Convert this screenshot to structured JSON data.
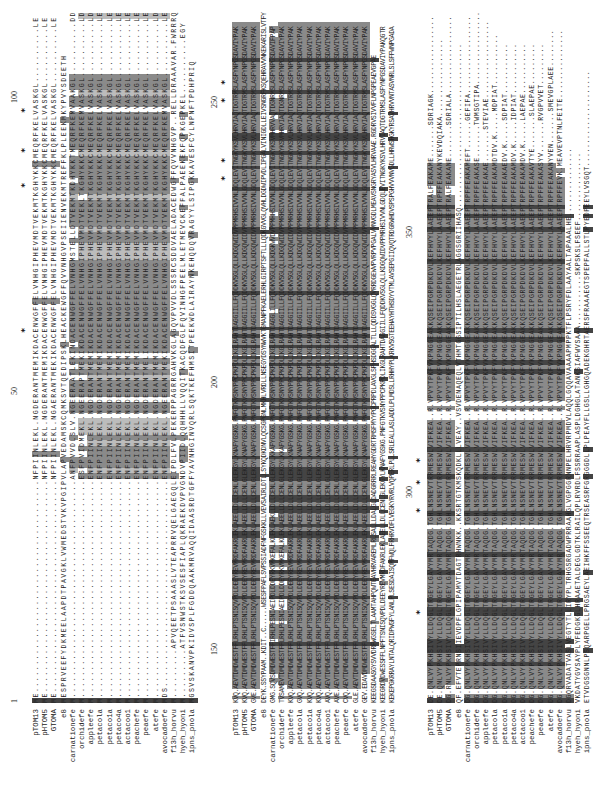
{
  "figure": {
    "type": "multiple_sequence_alignment",
    "orientation": "rotated-90-ccw",
    "sequence_names": [
      "pTOM13",
      "pHTOM5",
      "GTOMA",
      "e8",
      "carnationefe",
      "orchidefe",
      "appleefe",
      "petacola",
      "petaco1a",
      "petaco4a",
      "actacoo1",
      "peachefe",
      "peaefe",
      "atefe",
      "avocadoefe",
      "f13h_horvu",
      "hyeh_hyoni",
      "ipns_pnola"
    ],
    "colors": {
      "identical": "#444444",
      "similar": "#8a8a8a",
      "weak": "#bcbcbc",
      "text": "#222222",
      "background": "#ffffff"
    }
  },
  "panels": [
    {
      "id": "block-1",
      "ruler": [
        {
          "label": "1",
          "pos": 100
        },
        {
          "label": "50",
          "pos": 408
        },
        {
          "label": "100",
          "pos": 700
        }
      ],
      "stars": [
        470,
        615,
        650,
        690
      ],
      "rows": [
        {
          "name": "pTOM13",
          "seq": "ME.......................................NFPIINLEKL.NGDERANTMEMIKDACENWGFFELVNHGIPHEVMDTVEKMTKGHYKKCMEQRFKELVASKGL..........LE"
        },
        {
          "name": "pHTOM5",
          "seq": "ME.......................................NFPIINLEKL.NGDERANTMEMIKDACENWGFFELVNHGIPHEVMDTVEKMTKGHYKKCMEQRFKELVASKGL..........LE"
        },
        {
          "name": "GTOMA",
          "seq": "ME.......................................NFPIINLEKL.NGAERANTMEKIKDACENWGFFELVNHGIPHEVMDTVEKMTKGHYKKCMEQRFKELVASKGL..........LE"
        },
        {
          "name": "e8",
          "seq": "MESPRVEEFYDKMEELAAPDTPAVGKLVWMEDSTVKVPGIPVLAPVEDAMSKCQMKSVTQEDIPSKLHEACKEWGFFQVVNHGVPSEIIENVEKMTREFFKLPLEEKMKYPVYSDEETH"
        },
        {
          "name": "carnationefe",
          "seq": "M........................................ANFPVVDLSLV.NGEERAATLEKINDACENWGFFELVNHGMSTELLDTVEKMTKDHYKKTMEQRFKEMVAAKGL..........DD"
        },
        {
          "name": "orchidefe",
          "seq": "M........................................ESFPVIDMEKL.NGEERAPTMEKIKDACENWGFFELVNHGIPHEVMDTVEKLTKGHYKKCMEQRFKEMVASKGL..........LD"
        },
        {
          "name": "appleefe",
          "seq": "M........................................ENFPIINLEKL.NGDERANTMEMIKDACENWGFFELVNHGIPHEVMDTVEKMTKGHYKKCMEQRFKELVASKGL..........LD"
        },
        {
          "name": "petacola",
          "seq": "M........................................ENFPIINLEKL.NGDERANTMEMIKDACENWGFFELVNHGIPHEVMDTVEKMTKGHYKKCMEQRFKELVASKGL..........LE"
        },
        {
          "name": "petaco1a",
          "seq": "M........................................ENFPIINLEKL.NGDERANTMEMIKDACENWGFFELVNHGIPHEVMDTVEKMTKGHYKKCMEQRFKELVASKGL..........LE"
        },
        {
          "name": "petaco4a",
          "seq": "M........................................ENFPIINLEKL.NGDERANTMEMIKDACENWGFFELVNHGIPHEVMDTVEKMTKGHYKKCMEQRFKELVASKGL..........LE"
        },
        {
          "name": "actacoo1",
          "seq": "M........................................ENFPIINLEKL.NGDERANTMEMIKDACENWGFFELVNHGIPHEVMDTVEKMTKGHYKKCMEQRFKELVASKGL..........LE"
        },
        {
          "name": "peachefe",
          "seq": "M........................................ENFPIINLEKL.NGDERANTMEMIKDACENWGFFELVNHGIPHEVMDTVEKMTKGHYKKCMEQRFKELVASKGL..........LE"
        },
        {
          "name": "peaefe",
          "seq": "M........................................ENFPIINLEKL.NGDERANTMELIKDACENWGFFELVNHGIPHEVMDTVEKMTKGHYKKCMEQRFKELVASKGL..........LE"
        },
        {
          "name": "atefe",
          "seq": "M........................................ENFPIINLEKL.NGDERANTMEMIKDACENWGFFELVNHGIPHEVMDTVEKMTKGHYKKCMEQRFKELVASKGL..........LD"
        },
        {
          "name": "avocadoefe",
          "seq": "MDS......................................ENFPIINLEKL.NGEERANTMEKIKDACENWGFFELVNHGIPHEVMDTVEKMTKGHYKKCMEQRFKEMVASKGL..........LE"
        },
        {
          "name": "f13h_horvu",
          "seq": "M.........APVQEETPSAAASLVTEAPRRVQELGAEGQLEIPDLFVLPEKERPPAGRRGAHVKGLAGQVPVVDLSSSRCSDDVAELADACEDWGFFQVVNHGVP..RELLDRAAAVAR.FWRRRQ"
        },
        {
          "name": "hyeh_hyoni",
          "seq": "M.........ATFVSNWSTKSVSESFIAPLQKRAEKDVPVGNDVPIIDLQQHHHLLVQQITKACQDFGLFQVINHGFPEELMLETMEVCKEFFALPAEEKEKFQPKGEPKEL..........EGY"
        },
        {
          "name": "ipns_pnola",
          "seq": "MGSVSKANVPKIDVSPLFGDDQAAKMRVAQQIDAASRDTGFFYAVNHGINVQRLSQKTKEFHMSITPEEKWDLAIRAYNKEHQDQVRAGYYLSIPGKKAVESFCYLNPNFTPDHPRIQ"
        }
      ]
    },
    {
      "id": "block-2",
      "ruler": [
        {
          "label": "150",
          "pos": 148
        },
        {
          "label": "200",
          "pos": 415
        },
        {
          "label": "250",
          "pos": 695
        }
      ],
      "stars": [
        622,
        640,
        700,
        718
      ],
      "rows": [
        {
          "name": "pTOM13",
          "seq": "KVQ.AEVTDMDWESTFFLRHLPTSNISQVPDLDEEYREVMRDFAKRLEKLAEELLDLLCENLGLEKGYLKNAFYGSKG.PNFGTKVSNYPPCPKPDLIKGLRAHTDAGGIILLFQDDKVSGLQLLKDGQWIDVPPMRHSIVVNLGDQLEVITNGKYKSVLHRVIAQTDGTRMSLASFYNPGSDAVIYPAK"
        },
        {
          "name": "pHTOM5",
          "seq": "KVQ.AEVTDMDWESTFFLRHLPTSNISQVPDLDEEYREVMRDFAKRLEKLAEELLDLLCENLGLEKGYLKNAFYGSKG.PNFGTKVSNYPPCPKPDLIKGLRAHTDAGGIILLFQDDKVSGLQLLKDGQWIDVPPMRHSIVVNLGDQLEVITNGKYKSVLHRVIAQTDGTRMSLASFYNPGSDAVIYPAK"
        },
        {
          "name": "GTOMA",
          "seq": "GVE.AEVTDMDWESTFFLRHLPTSNISQVPDLDEEYREVMRDFAKRLEKLAEELLDLLCENLGLEKGYLKNAFYGSKG.PNFGTKVSNYPPCPKPDLIKGLRAHTDAGGIILLFQDDKVSGLQLLKDGQWIDVPPMRHSIVVNLGDQLEVITNGKYKSVLHRVIAQTDGTRMSLASFYNPGSDAVIYPAK"
        },
        {
          "name": "e8",
          "seq": "DEYK.SSYPAAM..KDIT..C......WSESFPAFLSVPSSIADFNFGSKKLLVEVSAIRLDTLLSYKQDKDNVLQCSGPGNLMKHLVRDLLNSEGYDSYNWVKTGMANPFKAELERHLGIRPTSFTLLLQDKGVVGLQVHLDGDWIPVDLIPGALVINIGDLLEIVSNGRFKSQEHRAVVNKEKARISLVTFY"
        },
        {
          "name": "carnationefe",
          "seq": "GMG.SQVSDMDWESTFFIRHLPESNIAEIPDLDDEYRKVMKEFALKLEKLAEKLLDLLCENLGLEKGYLKKAFYGSKG.PNFGTKVSNYPPCPKPDLIKGLRAHTDAGGLILLFQDDKVSGLQLLKDGKWVDVPPMHHSIVVNLGDQLEVITNGKYKSVMHRVVAQTDGNRMSLASFYNPGSDAVIFPAP"
        },
        {
          "name": "orchidefe",
          "seq": "TVSAMEVTDMDWESTFFLRHLPESNIAEIPDLDDEYRKVMKEFALKLEKLAEELLDLLCENLGLEKGYLKKAFYGSKG.PNFGTKVSNYPPCPKPDLIKGLRAHTDAGGIILLFQDDKVSGLQLLKDGQWIDVPPMRHSIVVNLGDQLEVITNGKYKSVMHRVIAQTDGNRMSLASFYNPGSDAVIYPAK"
        },
        {
          "name": "appleefe",
          "seq": "KVQ.AEVTDMDWESTFFLRHLPTSNISQVPDLDEEYREVMRDFAKRLEKLAEELLDLLCENLGLEKGYLKNAFYGSKG.PNFGTKVSNYPPCPKPDLIKGLRAHTDAGGIILLFQDDKVSGLQLLKDGQWIDVPPMRHSIVVNLGDQLEVITNGKYKSVLHRVIAQTDGTRMSLASFYNPGSDAVIYPAK"
        },
        {
          "name": "petacola",
          "seq": "GVQ.AEVTDMDWESTFFLRHLPTSNISQVPDLDEEYREVMRDFAKRLEKLAEELLDLLCENLGLEKGYLKNAFYGSKG.PNFGTKVSNYPPCPKPDLIKGLRAHTDAGGIILLFQDDKVSGLQLLKDGQWIDVPPMRHSIVVNLGDQLEVITNGKYKSVLHRVIAQTDGTRMSLASFYNPGSDAVIYPAK"
        },
        {
          "name": "petaco1a",
          "seq": "KVQ.AEVTDMDWESTFFLRHLPTSNISQVPDLDEEYREVMRDFAKRLEKLAEELLDLLCENLGLEKGYLKNAFYGSKG.PNFGTKVSNYPPCPKPDLIKGLRAHTDAGGIILLFQDDKVSGLQLLKDGQWIDVPPMRHSIVVNLGDQLEVITNGKYKSVLHRVIAQTDGTRMSLASFYNPGSDAVIYPAK"
        },
        {
          "name": "petaco4a",
          "seq": "KVQ.AEVTDMDWESTFFLRHLPTSNISQVPDLDEEYREVMRDFAKRLEKLAEELLDLLCENLGLEKGYLKNAFYGSKG.PNFGTKVSNYPPCPKPDLIKGLRAHTDAGGIILLFQDDKVSGLQLLKDGQWIDVPPMRHSIVVNLGDQLEVITNGKYKSVLHRVIAQTDGTRMSLASFYNPGSDAVIYPAK"
        },
        {
          "name": "actacoo1",
          "seq": "AVQ.AEVTDMDWESTFFLRHLPTSNISQVPDLDEEYREVMRDFAKRLEKLAEELLDLLCENLGLEKGYLKNAFYGSKG.PNFGTKVSNYPPCPKPDLIKGLRAHTDAGGIILLFQDDKVSGLQLLKDGQWIDVPPMRHSIVVNLGDQLEVITNGKYKSVLHRVIAQTDGTRMSLASFYNPGSDAVIYPAK"
        },
        {
          "name": "peachefe",
          "seq": "AVE.AEVTDMDWESTFFLRHLPTSNISQVPDLDEEYREVMRDFAKRLEKLAEELLDLLCENLGLEKGYLKNAFYGSKG.PNFGTKVSNYPPCPKPDLIKGLRAHTDAGGIILLFQDDKVSGLQLLKDGQWIDVPPMRHSIVVNLGDQLEVITNGKYKSVLHRVIAQTDGTRMSLASFYNPGSDAVIYPAK"
        },
        {
          "name": "peaefe",
          "seq": "CVQ.AEVTDMDWESTFFLRHLPTSNISQVPDLDEEYREVMRDFAKRLEKLAEELLDLLCENLGLEKGYLKNAFYGSKG.PNFGTKVSNYPPCPKPDLIKGLRAHTDAGGIILLFQDDKVSGLQLLKDGQWIDVPPMRHSIVVNLGDQLEVITNGKYKSVLHRVIAQTDGTRMSLASFYNPGSDAVIYPAK"
        },
        {
          "name": "atefe",
          "seq": "GLE.AEVTDMDWESTFFLRHLPTSNISQVPDLDEEYREVMRDFAKRLEKLAEELLDLLCENLGLEKGYLKNAFYGSKG.PNFGTKVSNYPPCPKPDLIKGLRAHTDAGGIILLFQDDKVSGLQLLKDGQWIDVPPMRHSIVVNLGDQLEVITNGKYKSVLHRVIAQTDGTRMSLASFYNPGSDAVIYPAK"
        },
        {
          "name": "avocadoefe",
          "seq": "GEV.EDAVDMDWESTFFLRHLPTSNISQVPDLDEEYREVMRDFAKRLEKLAEELLDLLCENLGLEKGYLKNAFYGSKG.PNFGTKVSNYPPCPKPDLIKGLRAHTDAGGIILLFQDDKVSGLQLLKDGQWIDVPPMRHSIVVNLGDQLEVITNGKYKSVLHRVIAQTDGTRMSLASFYNPGSDAVIYPAK"
        },
        {
          "name": "f13h_horvu",
          "seq": "KEEGSDAASGYSVVDRFWGSELTLAAMTAHPQWTEAVHRVAREMLRLSALLLDALGLDADGRRRLREAHYGDRTRMSFMYYPGCPRPDLAVGLSPHSDGGALTLLLQDDSVGGLQVRRDGEWVPVRPVPGALVVNVGDLMEAVSNGRYASVLHRVAAE.RGDRVSIVVFLNPGPEAEVGPAE"
        },
        {
          "name": "hyeh_hyoni",
          "seq": "KEEGRDVDWESSFFLNPFTSNISQVPDLDEEYREVMRDFAKRLEKLAEELLDLLCENLGLEKGYLKNAFYGSKG.PNFGTKVSNYPPCPKPDLIKGLRAHTDAGGIILLFQDDKVSGLQLLKDGQWIDVPPMRHSIVVNLGDQLEVITNGKYKSVLHRVIAQTDGTRMSLASFYNPGSDAVIYPAKQGTR"
        },
        {
          "name": "ipns_pnola",
          "seq": "KEKEPGKRRAYLNTALQRIDPWGFYLANLPLSESDAISQMFWQLFRHRVDFLVEGKYRVRLVQPERLPLLSRLEALLASLADDLPLMDSLLRHHYPLKRKVSGTEEHAYHTHSDYVTMLAVSEPGIIQVQTRDGRWHDVSPSPGHVVVNVGDLLHRWSHGKYRSAVHRVVNTASVNRLSLSFFWNPGADA"
        }
      ]
    },
    {
      "id": "block-3",
      "ruler": [
        {
          "label": "300",
          "pos": 305
        },
        {
          "label": "350",
          "pos": 565
        }
      ],
      "stars": [
        188,
        290,
        318,
        340
      ],
      "rows": [
        {
          "name": "pTOM13",
          "seq": "DE.QNLVYPKHSIVYLLDQGLTRGEYLGAVYMRTAQDG.TGHLNSNEVTRRMESWLVIFKEA..R.VPVYTPKFVKPNGGEAKKQSEIPGRPDKDVLKEFHVYLAAEEPTRALFEAKAME.......SDRIAGK................."
        },
        {
          "name": "pHTOM5",
          "seq": "DE.QNLVYPKHSIVYLLDQGLTRGEYLGAVYMRTAQDG.TGHLNSNEVTRRMESWLVIFKEA..R.VPVYTPKFVKPNGGEAKKQSEIPGRPDKDVLKEFHVYLAAEEPTRPFFEAKANYKEVDQIAKA................."
        },
        {
          "name": "GTOMA",
          "seq": "DG.RNLVYPKHSIVYLLDQGLTRGEYLGAVYMRTAQDG.TGHLNSNEVTRRMESWLVIFKEA..R.VPVYTPKFVKPNGGEAKKQSEIPGRPDKDVLKEFHVYLAAEEPTRALFEAKANE.......SDRIALA................."
        },
        {
          "name": "e8",
          "seq": "QF.EFVTEPRNSIIEVDPFLGPIPAMVTDAGTRHWNKK..KKSRTGTKMSKQDKLLLVEAY..VSVDENAQEQLVTHMTGGSIPTILHSLAEGETRLAGGSGRIIHASQ...................................."
        },
        {
          "name": "carnationefe",
          "seq": "DG.QNLVYPKHSIVYLLDQGLTRGEYLGAVYMRTAQDG.TGHLNSNEVTRRMESWLVIFKEA..R.VPVYTPKFVKPNGGEAKKQSEIPGRPDKDVLKEFHVYLAAEEPTRPFFEAKAMEFT......GEFIFA................."
        },
        {
          "name": "orchidefe",
          "seq": "DG.QNLVYPKHSIVYLLDQGLTRGEYLGAVYMRTAQDG.TGHLNSNEVTRRMESWLVIFKEA..R.VPVYTPKFVKPNGGEAKKQSEIPGRPDKDVLKEFHVYLAAEEPTRPFFEAKASE.......TWMSGTIPA................"
        },
        {
          "name": "appleefe",
          "seq": "DG.QNLVYPKHSIVYLLDQGLTRGEYLGAVYMRTAQDG.TGHLNSNEVTRRMESWLVIFKEA..R.VPVYTPKFVKPNGGEAKKQSEIPGRPDKDVLKEFHVYLAAEEPTRPFFEAKAE.......STEVIAE................."
        },
        {
          "name": "petacola",
          "seq": "DG.QNLVYPKHSIVYLLDQGLTRGEYLGAVYMRTAQDG.TGHLNSNEVTRRMESWLVIFKEA..R.VPVYTPKFVKPNGGEAKKQSEIPGRPDKDVLKEFHVYLAAEEPTRPFFEAKAMDTDV.K.....MDPIAT..........."
        },
        {
          "name": "petaco1a",
          "seq": "DG.QNLVYPKHSIVYLLDQGLTRGEYLGAVYMRTAQDG.TGHLNSNEVTRRMESWLVIFKEA..R.VPVYTPKFVKPNGGEAKKQSEIPGRPDKDVLKEFHVYLAAEEPTRPFFEAKAEDV.K.....SDPIAT..........."
        },
        {
          "name": "petaco4a",
          "seq": "DG.QNLVYPKHSIVYLLDQGLTRGEYLGAVYMRTAQDG.TGHLNSNEVTRRMESWLVIFKEA..R.VPVYTPKFVKPNGGEAKKQSEIPGRPDKDVLKEFHVYLAAEEPTRPFFEAKAMDV.K.....IDPIAT..........."
        },
        {
          "name": "actacoo1",
          "seq": "DG.QNLVYPKHSIVYLLDQGLTRGEYLGAVYMRTAQDG.TGHLNSNEVTRRMESWLVIFKEA..R.VPVYTPKFVKPNGGEAKKQSEIPGRPDKDVLKEFHVYLAAEEPTRPFFEAKAMDV.K.....LAEPAE..........."
        },
        {
          "name": "peachefe",
          "seq": "DG.QNLVYPKHSIVYLLDQGLTRGEYLGAVYMRTAQDG.TGHLNSNEVTRRMESWLVIFKEA..R.VPVYTPKFVKPNGGEAKKQSEIPGRPDKDVLKEFHVYLAAEEPTRPFFEAKAVTYE.......SLAEPAE........."
        },
        {
          "name": "peaefe",
          "seq": "DG.QNLVYPKHSIVYLLDQGLTRGEYLGAVYMRTAQDG.TGHLNSNEVTRRMESWLVIFKEA..R.VPVYTPKFVKPNGGEAKKQSEIPGRPDKDVLKEFHVYLAAEEPTRPFFEAKASYV.......RVGPVVET........."
        },
        {
          "name": "atefe",
          "seq": "DG.QNLVYPKHSIVYLLDQGLTRGEYLGAVYMRTAQDG.TGHLNSNEVTRRMESWLVIFKEA..R.VPVYTPKFVKPNGGEAKKQSEIPGRPDKDVLKEFHVYLAAEEPTRPFFEAKANYVEN.......SMEVGPLAEE........"
        },
        {
          "name": "avocadoefe",
          "seq": "DG.QNLVYPKHSIVYLLDQGLTRGEYLGAVYMRTAQDG.TGHLNSNEVTRRMESWLVIFKEA..R.VPVYTPKFVKPNGGEAKKQSEIPGRPDKDVLKEFHVYLAAEEPTRPFFEVK.MEAVEVPTNLFEITE..............."
        },
        {
          "name": "f13h_horvu",
          "seq": "DGQRVADATVASLVEGTYTLLIRYPLTRHGSRGADWPRRAAHGLVGPGGRNNPELHRVRPMDVLAQQLGQQAVAAAAPMPPKTFLPSRYFDLAAYAALTAPAAALHE..............."
        },
        {
          "name": "hyeh_hyoni",
          "seq": "VKDATYGVSAYPLYFEDGKGLHRAAETALDEGLGDTKLRAILQPLRVRDLFSSRRAAPLASPLDGHGLATANKSIAFWVSAAA...........SKPSKSLFSEEF..............."
        },
        {
          "name": "ipns_pnola",
          "seq": "ETVDGSGNNLPSQARPGELLPRGSAEYLAEIHKFFSSEEQTRSEASRFGRGGGDLLPLPEAYFLLGSLLGHGQADEKGHRTAERSFRAAAEGTSPEPFALLSTLPYEDPEEYLVSGQT....................."
        }
      ]
    }
  ]
}
